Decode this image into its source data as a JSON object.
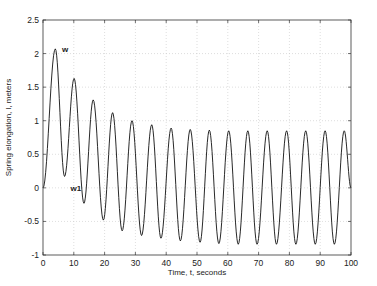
{
  "chart_data": {
    "type": "line",
    "title": "",
    "xlabel": "Time, t, seconds",
    "ylabel": "Spring elongation, l, meters",
    "xlim": [
      0,
      100
    ],
    "ylim": [
      -1,
      2.5
    ],
    "xticks": [
      0,
      10,
      20,
      30,
      40,
      50,
      60,
      70,
      80,
      90,
      100
    ],
    "xtick_labels": [
      "0",
      "10",
      "20",
      "30",
      "40",
      "50",
      "60",
      "70",
      "80",
      "90",
      "100"
    ],
    "yticks": [
      -1,
      -0.5,
      0,
      0.5,
      1,
      1.5,
      2,
      2.5
    ],
    "ytick_labels": [
      "-1",
      "-0.5",
      "0",
      "0.5",
      "1",
      "1.5",
      "2",
      "2.5"
    ],
    "grid": true,
    "legend": null,
    "annotations": [
      {
        "text": "w",
        "x": 6.2,
        "y": 2.07
      },
      {
        "text": "w1",
        "x": 8.9,
        "y": 0.0
      }
    ],
    "series": [
      {
        "name": "spring elongation",
        "color": "#111111",
        "description": "Damped transient superposed on steady oscillation (~±0.85 m, period ≈ 6.3 s); points are curve extrema",
        "points": [
          [
            0,
            0
          ],
          [
            4.0,
            2.07
          ],
          [
            7.0,
            0.17
          ],
          [
            10.1,
            1.63
          ],
          [
            13.3,
            -0.23
          ],
          [
            16.3,
            1.31
          ],
          [
            19.6,
            -0.48
          ],
          [
            22.6,
            1.12
          ],
          [
            25.7,
            -0.64
          ],
          [
            28.9,
            1.0
          ],
          [
            32.0,
            -0.71
          ],
          [
            35.3,
            0.94
          ],
          [
            38.3,
            -0.75
          ],
          [
            41.6,
            0.89
          ],
          [
            44.6,
            -0.79
          ],
          [
            47.8,
            0.87
          ],
          [
            51.0,
            -0.81
          ],
          [
            54.0,
            0.86
          ],
          [
            57.1,
            -0.83
          ],
          [
            60.3,
            0.85
          ],
          [
            63.4,
            -0.84
          ],
          [
            66.5,
            0.85
          ],
          [
            69.5,
            -0.84
          ],
          [
            72.8,
            0.85
          ],
          [
            75.8,
            -0.84
          ],
          [
            79.1,
            0.85
          ],
          [
            82.1,
            -0.84
          ],
          [
            85.3,
            0.85
          ],
          [
            88.4,
            -0.84
          ],
          [
            91.6,
            0.85
          ],
          [
            94.6,
            -0.84
          ],
          [
            97.8,
            0.85
          ],
          [
            100,
            0.0
          ]
        ]
      }
    ]
  },
  "layout": {
    "plot_left": 43,
    "plot_right": 351,
    "plot_top": 20,
    "plot_bottom": 255
  }
}
